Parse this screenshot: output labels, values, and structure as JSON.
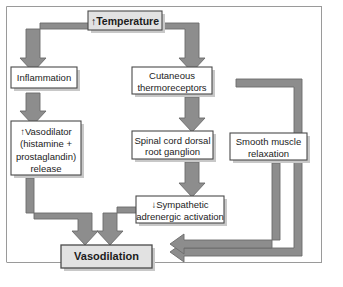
{
  "diagram": {
    "title_box": {
      "label": "↑Temperature"
    },
    "nodes": [
      {
        "id": "temperature",
        "label": "↑Temperature",
        "lines": [
          "↑Temperature"
        ],
        "emphasis": "bold",
        "fill": "#e2e2e2"
      },
      {
        "id": "inflammation",
        "label": "Inflammation",
        "lines": [
          "Inflammation"
        ],
        "emphasis": "normal",
        "fill": "#ffffff"
      },
      {
        "id": "vasodilator",
        "label": "↑Vasodilator (histamine + prostaglandin) release",
        "lines": [
          "↑Vasodilator",
          "(histamine +",
          "prostaglandin)",
          "release"
        ],
        "emphasis": "normal",
        "fill": "#ffffff"
      },
      {
        "id": "thermoreceptors",
        "label": "Cutaneous thermoreceptors",
        "lines": [
          "Cutaneous",
          "thermoreceptors"
        ],
        "emphasis": "normal",
        "fill": "#ffffff"
      },
      {
        "id": "ganglion",
        "label": "Spinal cord dorsal root ganglion",
        "lines": [
          "Spinal cord dorsal",
          "root ganglion"
        ],
        "emphasis": "normal",
        "fill": "#ffffff"
      },
      {
        "id": "sympathetic",
        "label": "↓Sympathetic adrenergic activation",
        "lines": [
          "↓Sympathetic",
          "adrenergic activation"
        ],
        "emphasis": "normal",
        "fill": "#ffffff"
      },
      {
        "id": "smoothmuscle",
        "label": "Smooth muscle relaxation",
        "lines": [
          "Smooth muscle",
          "relaxation"
        ],
        "emphasis": "normal",
        "fill": "#ffffff"
      },
      {
        "id": "vasodilation",
        "label": "Vasodilation",
        "lines": [
          "Vasodilation"
        ],
        "emphasis": "bold",
        "fill": "#e2e2e2"
      }
    ],
    "edges": [
      {
        "id": "temp-to-inflammation",
        "from": "temperature",
        "to": "inflammation",
        "direction": "down"
      },
      {
        "id": "temp-to-thermoreceptors",
        "from": "temperature",
        "to": "thermoreceptors",
        "direction": "down"
      },
      {
        "id": "inflammation-to-vasodilator",
        "from": "inflammation",
        "to": "vasodilator",
        "direction": "down"
      },
      {
        "id": "vasodilator-to-vasodilation",
        "from": "vasodilator",
        "to": "vasodilation",
        "direction": "down"
      },
      {
        "id": "thermoreceptors-to-ganglion",
        "from": "thermoreceptors",
        "to": "ganglion",
        "direction": "down"
      },
      {
        "id": "ganglion-to-sympathetic",
        "from": "ganglion",
        "to": "sympathetic",
        "direction": "down"
      },
      {
        "id": "sympathetic-to-vasodilation",
        "from": "sympathetic",
        "to": "vasodilation",
        "direction": "down"
      },
      {
        "id": "thermoreceptors-to-vasodilation",
        "from": "thermoreceptors",
        "to": "vasodilation",
        "direction": "left"
      },
      {
        "id": "smoothmuscle-to-vasodilation",
        "from": "smoothmuscle",
        "to": "vasodilation",
        "direction": "left"
      }
    ],
    "colors": {
      "arrow_fill": "#8d8d8d",
      "arrow_stroke": "#6b6b6b",
      "box_stroke": "#4a4a4a",
      "box_fill_plain": "#ffffff",
      "box_fill_shaded": "#e2e2e2",
      "text": "#1c1c1c",
      "frame": "#9a9a9a",
      "shadow": "#c8c8c8"
    }
  }
}
